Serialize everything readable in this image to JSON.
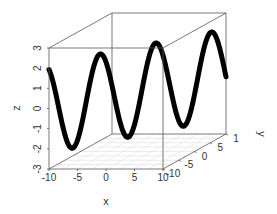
{
  "chart_data": {
    "type": "line",
    "subtype": "3d-scatter-line",
    "title": "",
    "xlabel": "x",
    "ylabel": "y",
    "zlabel": "z",
    "xlim": [
      -10,
      10
    ],
    "ylim": [
      -10,
      10
    ],
    "zlim": [
      -3,
      3
    ],
    "x_ticks": [
      -10,
      -5,
      0,
      5,
      10
    ],
    "y_ticks": [
      -10,
      -5,
      0,
      5,
      10
    ],
    "y_tick_labels": [
      "-10",
      "-5",
      "0",
      "5",
      "1"
    ],
    "z_ticks": [
      -3,
      -2,
      -1,
      0,
      1,
      2,
      3
    ],
    "grid": "floor",
    "box": true,
    "series": [
      {
        "name": "curve",
        "color": "#000000",
        "description": "x = y = t, t from -10 to 10; z ≈ 2.2·sin(t − 0.5)",
        "points": [
          {
            "x": -10,
            "y": -10,
            "z": 1.94
          },
          {
            "x": -9,
            "y": -9,
            "z": 0.99
          },
          {
            "x": -8,
            "y": -8,
            "z": -0.21
          },
          {
            "x": -7,
            "y": -7,
            "z": -1.38
          },
          {
            "x": -6,
            "y": -6,
            "z": -2.12
          },
          {
            "x": -5,
            "y": -5,
            "z": -2.13
          },
          {
            "x": -4,
            "y": -4,
            "z": -1.36
          },
          {
            "x": -3,
            "y": -3,
            "z": -0.08
          },
          {
            "x": -2,
            "y": -2,
            "z": 1.32
          },
          {
            "x": -1,
            "y": -1,
            "z": 2.19
          },
          {
            "x": 0,
            "y": 0,
            "z": -1.05
          },
          {
            "x": 1,
            "y": 1,
            "z": 1.05
          },
          {
            "x": 2,
            "y": 2,
            "z": 2.19
          },
          {
            "x": 3,
            "y": 3,
            "z": 1.32
          },
          {
            "x": 4,
            "y": 4,
            "z": -0.77
          },
          {
            "x": 5,
            "y": 5,
            "z": -2.15
          },
          {
            "x": 6,
            "y": 6,
            "z": -1.56
          },
          {
            "x": 7,
            "y": 7,
            "z": 0.47
          },
          {
            "x": 8,
            "y": 8,
            "z": 2.07
          },
          {
            "x": 9,
            "y": 9,
            "z": 1.74
          },
          {
            "x": 10,
            "y": 10,
            "z": -0.17
          }
        ]
      }
    ],
    "curve_function": {
      "amplitude": 2.2,
      "phase": -0.5,
      "t_min": -10,
      "t_max": 10
    }
  },
  "labels": {
    "x": "x",
    "y": "y",
    "z": "z"
  }
}
